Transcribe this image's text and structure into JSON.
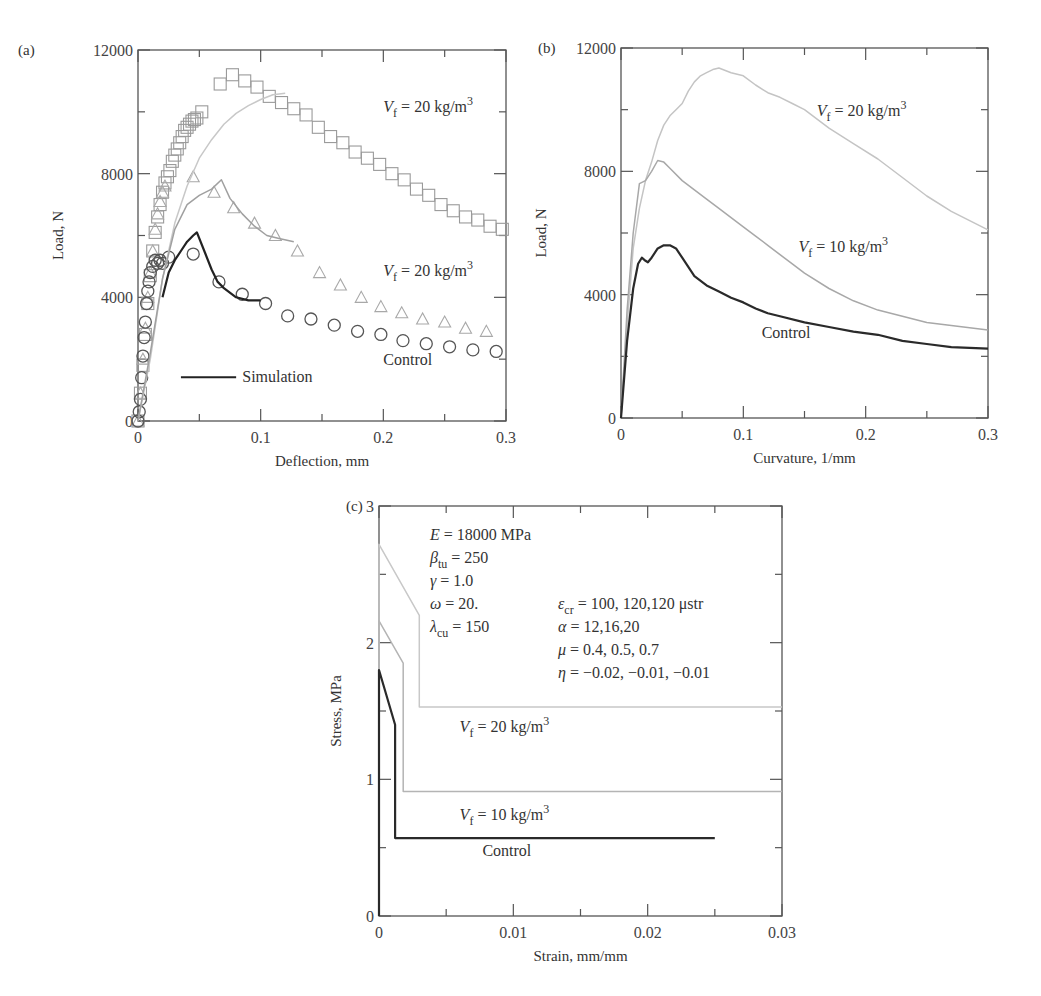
{
  "chart_data": [
    {
      "id": "a",
      "panel_label": "(a)",
      "type": "scatter",
      "title": "",
      "xlabel": "Deflection, mm",
      "ylabel": "Load, N",
      "xlim": [
        0,
        0.3
      ],
      "ylim": [
        0,
        12000
      ],
      "xticks": [
        0,
        0.1,
        0.2,
        0.3
      ],
      "xtick_labels": [
        "0",
        "0.1",
        "0.2",
        "0.3"
      ],
      "yticks": [
        0,
        4000,
        8000,
        12000
      ],
      "ytick_labels": [
        "0",
        "4000",
        "8000",
        "12000"
      ],
      "grid": false,
      "series": [
        {
          "name": "Vf = 20 kg/m3 (experiment)",
          "marker": "square",
          "color": "#9a9a9a",
          "x": [
            0,
            0.002,
            0.004,
            0.006,
            0.008,
            0.01,
            0.012,
            0.014,
            0.016,
            0.018,
            0.02,
            0.022,
            0.024,
            0.026,
            0.028,
            0.03,
            0.032,
            0.034,
            0.036,
            0.038,
            0.04,
            0.042,
            0.044,
            0.046,
            0.048,
            0.052,
            0.067,
            0.077,
            0.087,
            0.097,
            0.107,
            0.117,
            0.127,
            0.137,
            0.147,
            0.157,
            0.167,
            0.177,
            0.187,
            0.197,
            0.207,
            0.217,
            0.227,
            0.237,
            0.247,
            0.257,
            0.267,
            0.277,
            0.287,
            0.297
          ],
          "y": [
            0,
            900,
            1800,
            2800,
            3800,
            4700,
            5500,
            6100,
            6600,
            7000,
            7400,
            7700,
            7900,
            8100,
            8400,
            8600,
            8800,
            9000,
            9200,
            9400,
            9500,
            9600,
            9700,
            9750,
            9800,
            10000,
            10900,
            11200,
            11000,
            10800,
            10500,
            10300,
            10100,
            9900,
            9500,
            9200,
            9000,
            8700,
            8500,
            8300,
            8000,
            7800,
            7500,
            7300,
            7000,
            6800,
            6600,
            6500,
            6300,
            6200
          ]
        },
        {
          "name": "Vf = 10 kg/m3 (experiment)",
          "marker": "triangle",
          "color": "#a8a8a8",
          "x": [
            0,
            0.002,
            0.004,
            0.006,
            0.008,
            0.01,
            0.012,
            0.014,
            0.016,
            0.018,
            0.02,
            0.022,
            0.045,
            0.062,
            0.078,
            0.095,
            0.112,
            0.13,
            0.148,
            0.165,
            0.182,
            0.198,
            0.215,
            0.232,
            0.25,
            0.267,
            0.284
          ],
          "y": [
            0,
            900,
            2000,
            3000,
            4000,
            4800,
            5500,
            6200,
            6700,
            7100,
            7400,
            7600,
            7900,
            7400,
            6900,
            6400,
            6000,
            5500,
            4800,
            4400,
            4000,
            3700,
            3500,
            3300,
            3200,
            3000,
            2900
          ]
        },
        {
          "name": "Control (experiment)",
          "marker": "circle",
          "color": "#555555",
          "x": [
            0,
            0.001,
            0.002,
            0.003,
            0.004,
            0.005,
            0.006,
            0.007,
            0.008,
            0.009,
            0.01,
            0.012,
            0.014,
            0.016,
            0.018,
            0.02,
            0.025,
            0.045,
            0.066,
            0.085,
            0.104,
            0.122,
            0.141,
            0.16,
            0.179,
            0.198,
            0.216,
            0.235,
            0.254,
            0.273,
            0.292
          ],
          "y": [
            0,
            300,
            700,
            1400,
            2100,
            2700,
            3200,
            3800,
            4200,
            4500,
            4800,
            5000,
            5200,
            5100,
            5200,
            5100,
            5300,
            5400,
            4500,
            4100,
            3800,
            3400,
            3300,
            3100,
            2900,
            2800,
            2600,
            2500,
            2400,
            2300,
            2250
          ]
        },
        {
          "name": "Simulation Vf = 20 kg/m3",
          "line": "solid",
          "color": "#c8c8c8",
          "x": [
            0,
            0.01,
            0.02,
            0.03,
            0.04,
            0.05,
            0.06,
            0.07,
            0.08,
            0.09,
            0.1,
            0.11,
            0.12
          ],
          "y": [
            0,
            2000,
            4600,
            6400,
            7600,
            8500,
            9100,
            9600,
            9950,
            10200,
            10400,
            10550,
            10600
          ]
        },
        {
          "name": "Simulation Vf = 10 kg/m3",
          "line": "solid",
          "color": "#a0a0a0",
          "x": [
            0,
            0.01,
            0.02,
            0.03,
            0.04,
            0.05,
            0.06,
            0.068,
            0.075,
            0.085,
            0.095,
            0.105,
            0.115,
            0.127
          ],
          "y": [
            0,
            2200,
            4600,
            6200,
            7000,
            7300,
            7500,
            7800,
            7200,
            6700,
            6300,
            6000,
            5900,
            5800
          ]
        },
        {
          "name": "Simulation",
          "line": "solid",
          "color": "#222222",
          "x": [
            0.02,
            0.025,
            0.03,
            0.035,
            0.04,
            0.045,
            0.048,
            0.055,
            0.06,
            0.065,
            0.07,
            0.08,
            0.09,
            0.1
          ],
          "y": [
            4000,
            4800,
            5200,
            5500,
            5800,
            6000,
            6100,
            5400,
            4900,
            4500,
            4300,
            4000,
            3900,
            3900
          ]
        }
      ],
      "annotations": [
        {
          "text_pre": "V",
          "sub": "f",
          "text_post": " = 20 kg/m",
          "sup": "3",
          "x": 0.2,
          "y": 10000
        },
        {
          "text_pre": "V",
          "sub": "f",
          "text_post": " = 20 kg/m",
          "sup": "3",
          "x": 0.2,
          "y": 4700
        },
        {
          "text": "Control",
          "x": 0.2,
          "y": 1800
        },
        {
          "text": "Simulation",
          "x": 0.085,
          "y": 1250,
          "legend_line": [
            0.035,
            0.08
          ]
        }
      ]
    },
    {
      "id": "b",
      "panel_label": "(b)",
      "type": "line",
      "title": "",
      "xlabel": "Curvature, 1/mm",
      "ylabel": "Load, N",
      "xlim": [
        0,
        0.3
      ],
      "ylim": [
        0,
        12000
      ],
      "xticks": [
        0,
        0.1,
        0.2,
        0.3
      ],
      "xtick_labels": [
        "0",
        "0.1",
        "0.2",
        "0.3"
      ],
      "yticks": [
        0,
        4000,
        8000,
        12000
      ],
      "ytick_labels": [
        "0",
        "4000",
        "8000",
        "12000"
      ],
      "grid": false,
      "series": [
        {
          "name": "Vf = 20 kg/m3",
          "color": "#c4c4c4",
          "x": [
            0,
            0.005,
            0.01,
            0.015,
            0.02,
            0.025,
            0.03,
            0.035,
            0.04,
            0.045,
            0.05,
            0.055,
            0.06,
            0.065,
            0.07,
            0.075,
            0.08,
            0.09,
            0.1,
            0.11,
            0.12,
            0.13,
            0.14,
            0.15,
            0.17,
            0.19,
            0.21,
            0.23,
            0.25,
            0.27,
            0.3
          ],
          "y": [
            0,
            3000,
            5500,
            6800,
            7700,
            8300,
            9000,
            9500,
            9800,
            10000,
            10200,
            10600,
            10900,
            11100,
            11200,
            11300,
            11350,
            11200,
            11100,
            10800,
            10550,
            10400,
            10200,
            10000,
            9400,
            8900,
            8400,
            7800,
            7200,
            6700,
            6100
          ]
        },
        {
          "name": "Vf = 10 kg/m3",
          "color": "#a8a8a8",
          "x": [
            0,
            0.005,
            0.01,
            0.015,
            0.02,
            0.025,
            0.03,
            0.035,
            0.04,
            0.05,
            0.06,
            0.07,
            0.08,
            0.09,
            0.1,
            0.11,
            0.12,
            0.13,
            0.14,
            0.15,
            0.17,
            0.19,
            0.21,
            0.23,
            0.25,
            0.27,
            0.3
          ],
          "y": [
            0,
            3500,
            6000,
            7600,
            7700,
            8000,
            8350,
            8300,
            8100,
            7700,
            7400,
            7100,
            6800,
            6500,
            6200,
            5900,
            5600,
            5300,
            5000,
            4700,
            4200,
            3800,
            3500,
            3300,
            3100,
            3000,
            2850
          ]
        },
        {
          "name": "Control",
          "color": "#2a2a2a",
          "x": [
            0,
            0.005,
            0.01,
            0.014,
            0.017,
            0.02,
            0.022,
            0.025,
            0.03,
            0.035,
            0.04,
            0.045,
            0.05,
            0.055,
            0.06,
            0.07,
            0.08,
            0.09,
            0.1,
            0.11,
            0.12,
            0.13,
            0.15,
            0.17,
            0.19,
            0.21,
            0.23,
            0.25,
            0.27,
            0.3
          ],
          "y": [
            0,
            2500,
            4200,
            5000,
            5200,
            5100,
            5050,
            5200,
            5500,
            5600,
            5600,
            5500,
            5200,
            4900,
            4600,
            4300,
            4100,
            3900,
            3750,
            3550,
            3400,
            3300,
            3100,
            2950,
            2800,
            2700,
            2500,
            2400,
            2300,
            2250
          ]
        }
      ],
      "annotations": [
        {
          "text_pre": "V",
          "sub": "f",
          "text_post": " = 20 kg/m",
          "sup": "3",
          "x": 0.16,
          "y": 9800
        },
        {
          "text_pre": "V",
          "sub": "f",
          "text_post": " = 10 kg/m",
          "sup": "3",
          "x": 0.145,
          "y": 5400
        },
        {
          "text": "Control",
          "x": 0.115,
          "y": 2600
        }
      ]
    },
    {
      "id": "c",
      "panel_label": "(c)",
      "type": "line",
      "title": "",
      "xlabel": "Strain, mm/mm",
      "ylabel": "Stress, MPa",
      "xlim": [
        0,
        0.03
      ],
      "ylim": [
        0,
        3
      ],
      "xticks": [
        0,
        0.01,
        0.02,
        0.03
      ],
      "xtick_labels": [
        "0",
        "0.01",
        "0.02",
        "0.03"
      ],
      "yticks": [
        0,
        1,
        2,
        3
      ],
      "ytick_labels": [
        "0",
        "1",
        "2",
        "3"
      ],
      "grid": false,
      "series": [
        {
          "name": "Vf = 20 kg/m3",
          "color": "#c8c8c8",
          "x": [
            0,
            0,
            0.003,
            0.003,
            0.03
          ],
          "y": [
            0,
            2.72,
            2.2,
            1.53,
            1.53
          ]
        },
        {
          "name": "Vf = 10 kg/m3",
          "color": "#b4b4b4",
          "x": [
            0,
            0,
            0.0018,
            0.0018,
            0.03
          ],
          "y": [
            0,
            2.16,
            1.85,
            0.91,
            0.91
          ]
        },
        {
          "name": "Control",
          "color": "#2a2a2a",
          "x": [
            0,
            0,
            0.0012,
            0.0012,
            0.025
          ],
          "y": [
            0,
            1.8,
            1.4,
            0.57,
            0.57
          ]
        }
      ],
      "annotations": [
        {
          "text_pre": "V",
          "sub": "f",
          "text_post": " = 20 kg/m",
          "sup": "3",
          "x": 0.006,
          "y": 1.35
        },
        {
          "text_pre": "V",
          "sub": "f",
          "text_post": " = 10 kg/m",
          "sup": "3",
          "x": 0.006,
          "y": 0.7
        },
        {
          "text": "Control",
          "x": 0.0077,
          "y": 0.44
        }
      ],
      "parameters_left": [
        {
          "sym": "E",
          "sub": "",
          "val": " = 18000 MPa"
        },
        {
          "sym": "β",
          "sub": "tu",
          "val": " = 250"
        },
        {
          "sym": "γ",
          "sub": "",
          "val": "  = 1.0"
        },
        {
          "sym": "ω",
          "sub": "",
          "val": "  = 20."
        },
        {
          "sym": "λ",
          "sub": "cu",
          "val": " = 150"
        }
      ],
      "parameters_right": [
        {
          "sym": "ε",
          "sub": "cr",
          "val": " = 100, 120,120 μstr"
        },
        {
          "sym": "α",
          "sub": "",
          "val": " = 12,16,20"
        },
        {
          "sym": "μ",
          "sub": "",
          "val": " = 0.4, 0.5, 0.7"
        },
        {
          "sym": "η",
          "sub": "",
          "val": " = −0.02, −0.01, −0.01"
        }
      ]
    }
  ],
  "layout": {
    "a": {
      "x0": 138,
      "x1": 506,
      "y0": 421,
      "y1": 50
    },
    "b": {
      "x0": 621,
      "x1": 988,
      "y0": 418,
      "y1": 48
    },
    "c": {
      "x0": 379,
      "x1": 782,
      "y0": 916,
      "y1": 506
    }
  }
}
